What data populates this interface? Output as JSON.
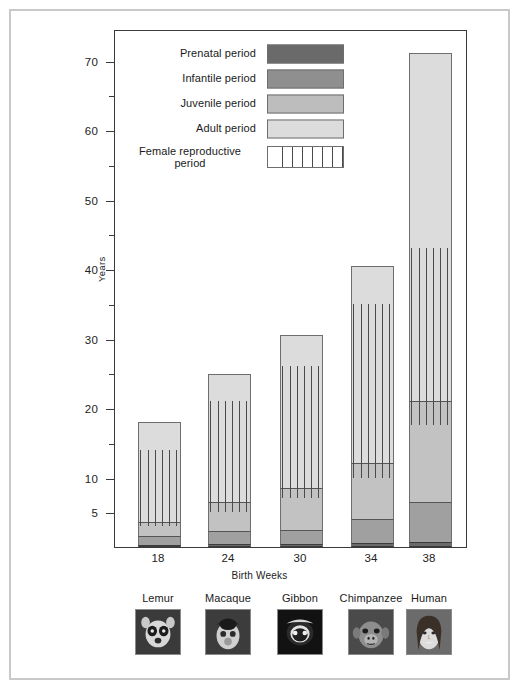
{
  "chart_data": {
    "type": "bar",
    "subtype": "stacked-bar",
    "title": "",
    "xlabel": "Birth Weeks",
    "ylabel": "Years",
    "ylim": [
      0,
      73
    ],
    "grid": false,
    "legend_position": "inside-top-left",
    "categories": [
      "18",
      "24",
      "30",
      "34",
      "38"
    ],
    "species": [
      "Lemur",
      "Macaque",
      "Gibbon",
      "Chimpanzee",
      "Human"
    ],
    "yticks": [
      5,
      10,
      20,
      30,
      40,
      50,
      60,
      70
    ],
    "yticks_minor": [
      15,
      25,
      35,
      45,
      55,
      65
    ],
    "series": [
      {
        "name": "Prenatal period",
        "color": "#6a6a6a",
        "values": [
          0.35,
          0.45,
          0.5,
          0.6,
          0.73
        ]
      },
      {
        "name": "Infantile period",
        "color": "#8f8f8f",
        "values": [
          1.2,
          1.8,
          2.0,
          3.5,
          5.8
        ]
      },
      {
        "name": "Juvenile period",
        "color": "#bdbdbd",
        "values": [
          2.0,
          4.2,
          6.0,
          8.0,
          14.5
        ]
      },
      {
        "name": "Adult period",
        "color": "#dcdcdc",
        "values": [
          14.4,
          18.5,
          22.0,
          28.4,
          50.0
        ]
      }
    ],
    "totals": [
      18.0,
      25.0,
      30.5,
      40.5,
      71.0
    ],
    "female_reproductive_period": [
      {
        "species": "Lemur",
        "start": 3.0,
        "end": 14.0
      },
      {
        "species": "Macaque",
        "start": 5.0,
        "end": 21.0
      },
      {
        "species": "Gibbon",
        "start": 7.0,
        "end": 26.0
      },
      {
        "species": "Chimpanzee",
        "start": 10.0,
        "end": 35.0
      },
      {
        "species": "Human",
        "start": 17.5,
        "end": 43.0
      }
    ]
  },
  "axes": {
    "y_title": "Years",
    "x_title": "Birth Weeks",
    "y_labels": [
      "70",
      "60",
      "50",
      "40",
      "30",
      "20",
      "10",
      "5"
    ],
    "x_labels": [
      "18",
      "24",
      "30",
      "34",
      "38"
    ]
  },
  "legend": {
    "items": [
      {
        "label": "Prenatal period",
        "swatch": "solid-dark-gray"
      },
      {
        "label": "Infantile period",
        "swatch": "solid-mid-gray"
      },
      {
        "label": "Juvenile period",
        "swatch": "solid-light-gray"
      },
      {
        "label": "Adult period",
        "swatch": "solid-pale-gray"
      },
      {
        "label": "Female reproductive period",
        "swatch": "vertical-hatch"
      }
    ]
  },
  "species_strip": {
    "items": [
      {
        "name": "Lemur",
        "photo": "lemur-photo"
      },
      {
        "name": "Macaque",
        "photo": "macaque-photo"
      },
      {
        "name": "Gibbon",
        "photo": "gibbon-photo"
      },
      {
        "name": "Chimpanzee",
        "photo": "chimpanzee-photo"
      },
      {
        "name": "Human",
        "photo": "human-photo"
      }
    ]
  }
}
